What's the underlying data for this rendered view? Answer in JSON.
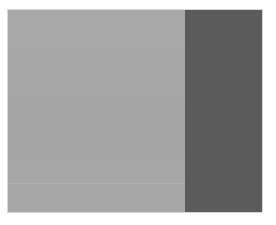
{
  "canvas": {
    "width": 276,
    "height": 225,
    "background": "#ffffff"
  },
  "panels": {
    "left": {
      "color": "#a7a7a7"
    },
    "right": {
      "color": "#5b5b5b"
    },
    "divider_line_color": "#b6b6b6"
  }
}
